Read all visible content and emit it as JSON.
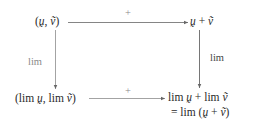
{
  "diagram": {
    "type": "commutative-diagram",
    "nodes": {
      "top_left": {
        "open": "(",
        "a": "ṵ",
        "sep": ", ",
        "b": "ṽ",
        "close": ")"
      },
      "top_right": {
        "a": "ṵ",
        "op": " + ",
        "b": "ṽ"
      },
      "bottom_left": {
        "open": "(lim ",
        "a": "ṵ",
        "sep": ", lim ",
        "b": "ṽ",
        "close": ")"
      },
      "bottom_right_line1": {
        "pre": "lim ",
        "a": "ṵ",
        "mid": " + lim ",
        "b": "ṽ"
      },
      "bottom_right_line2": {
        "pre": "= lim (",
        "a": "ṵ",
        "op": " + ",
        "b": "ṽ",
        "close": ")"
      }
    },
    "edges": {
      "top": {
        "label": "+"
      },
      "bottom": {
        "label": "+"
      },
      "left": {
        "label": "lim"
      },
      "right": {
        "label": "lim"
      }
    },
    "colors": {
      "line": "#777777",
      "label": "#8a8a8a",
      "text": "#2a2a2a"
    }
  }
}
